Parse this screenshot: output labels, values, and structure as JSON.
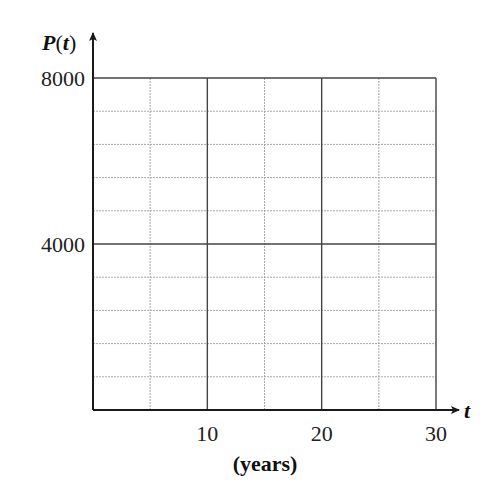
{
  "chart_data": {
    "type": "line",
    "title": "",
    "xlabel": "(years)",
    "x_variable": "t",
    "ylabel": "P(t)",
    "y_function": "P",
    "y_argument": "t",
    "xlim": [
      0,
      30
    ],
    "ylim": [
      0,
      8000
    ],
    "x_ticks": [
      10,
      20,
      30
    ],
    "x_tick_labels": [
      "10",
      "20",
      "30"
    ],
    "y_ticks": [
      4000,
      8000
    ],
    "y_tick_labels": [
      "4000",
      "8000"
    ],
    "grid": true,
    "x_minor_step": 5,
    "y_minor_step": 800,
    "series": [],
    "legend": null
  },
  "colors": {
    "axis": "#1a1a1a",
    "major_grid": "#444444",
    "minor_grid": "#a8a8a8",
    "text": "#222222"
  },
  "plot": {
    "left": 93,
    "right": 436,
    "top": 78,
    "bottom": 410
  }
}
